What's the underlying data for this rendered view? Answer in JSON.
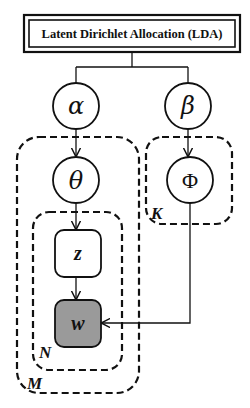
{
  "title": "Latent Dirichlet Allocation (LDA)",
  "nodes": {
    "alpha": {
      "symbol": "α",
      "type": "hyperparameter"
    },
    "beta": {
      "symbol": "β",
      "type": "hyperparameter"
    },
    "theta": {
      "symbol": "θ",
      "type": "latent"
    },
    "phi": {
      "symbol": "Φ",
      "type": "latent"
    },
    "z": {
      "symbol": "z",
      "type": "latent"
    },
    "w": {
      "symbol": "w",
      "type": "observed"
    }
  },
  "plates": {
    "M": "M",
    "N": "N",
    "K": "K"
  },
  "edges": [
    {
      "from": "alpha",
      "to": "theta"
    },
    {
      "from": "theta",
      "to": "z"
    },
    {
      "from": "z",
      "to": "w"
    },
    {
      "from": "beta",
      "to": "phi"
    },
    {
      "from": "phi",
      "to": "w"
    }
  ],
  "colors": {
    "stroke": "#111111",
    "observed_fill": "#9a9a9a",
    "background": "#ffffff"
  }
}
